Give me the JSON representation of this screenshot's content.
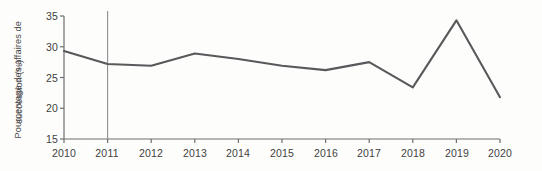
{
  "chart_data": {
    "type": "line",
    "title": "",
    "xlabel": "",
    "ylabel": "Pourcentage des affaires de succession (%)",
    "ylabel_lines": [
      "Pourcentage des affaires de",
      "succession (%)"
    ],
    "categories": [
      "2010",
      "2011",
      "2012",
      "2013",
      "2014",
      "2015",
      "2016",
      "2017",
      "2018",
      "2019",
      "2020"
    ],
    "x": [
      2010,
      2011,
      2012,
      2013,
      2014,
      2015,
      2016,
      2017,
      2018,
      2019,
      2020
    ],
    "values": [
      29.3,
      27.2,
      26.9,
      28.9,
      28.0,
      26.9,
      26.2,
      27.5,
      23.4,
      34.3,
      21.8
    ],
    "series": [
      {
        "name": "Pourcentage des affaires de succession",
        "values": [
          29.3,
          27.2,
          26.9,
          28.9,
          28.0,
          26.9,
          26.2,
          27.5,
          23.4,
          34.3,
          21.8
        ]
      }
    ],
    "ylim": [
      15,
      35
    ],
    "yticks": [
      15,
      20,
      25,
      30,
      35
    ],
    "ytick_labels": [
      "15",
      "20",
      "25",
      "30",
      "35"
    ],
    "xlim": [
      2010,
      2020
    ],
    "grid": false,
    "legend": false,
    "annotations": [
      {
        "type": "vertical-line",
        "at": 2011,
        "label": ""
      }
    ],
    "line_color": "#59595b",
    "axis_color": "#6e6e70",
    "background_color": "#fdfdfc"
  },
  "axes": {
    "y_tick_labels": [
      "35",
      "30",
      "25",
      "20",
      "15"
    ],
    "x_tick_labels": [
      "2010",
      "2011",
      "2012",
      "2013",
      "2014",
      "2015",
      "2016",
      "2017",
      "2018",
      "2019",
      "2020"
    ],
    "y_title_line_1": "Pourcentage des affaires de",
    "y_title_line_2": "succession (%)"
  }
}
